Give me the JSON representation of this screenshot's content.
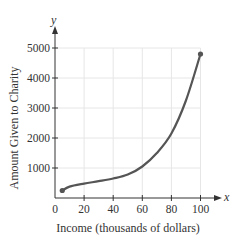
{
  "chart_data": {
    "type": "line",
    "title": "",
    "xlabel": "Income (thousands of dollars)",
    "ylabel": "Amount Given to Charity",
    "x_axis_var": "x",
    "y_axis_var": "y",
    "xlim": [
      0,
      100
    ],
    "ylim": [
      0,
      5000
    ],
    "x_ticks": [
      0,
      20,
      40,
      60,
      80,
      100
    ],
    "y_ticks": [
      1000,
      2000,
      3000,
      4000,
      5000
    ],
    "grid": true,
    "legend": null,
    "series": [
      {
        "name": "charity",
        "color": "#555555",
        "x": [
          5,
          10,
          20,
          30,
          40,
          50,
          60,
          70,
          80,
          90,
          100
        ],
        "y": [
          250,
          380,
          480,
          560,
          650,
          780,
          1050,
          1500,
          2150,
          3250,
          4800
        ],
        "endpoints_marked": true
      }
    ]
  },
  "colors": {
    "axis": "#333333",
    "grid": "#e6e6e6",
    "curve": "#555555"
  }
}
